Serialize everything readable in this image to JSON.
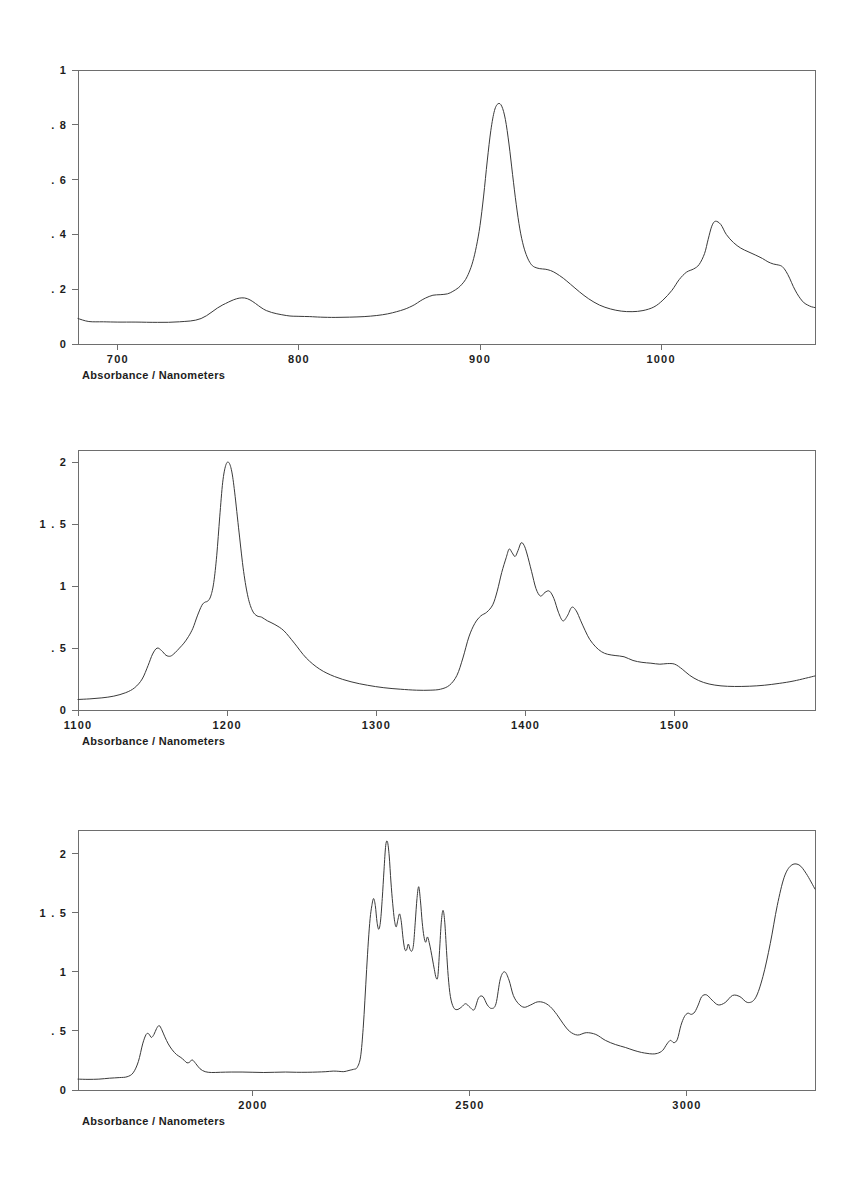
{
  "document": {
    "title": "Absorbance / Nanometers",
    "background_color": "#ffffff",
    "trace_color": "#3a3a3a",
    "axis_color": "#6e6e6e",
    "panel_count": 3
  },
  "chart_data": [
    {
      "type": "line",
      "title": "",
      "caption": "Absorbance / Nanometers",
      "xlabel": "Nanometers",
      "ylabel": "Absorbance",
      "xlim": [
        678,
        1085
      ],
      "ylim": [
        0,
        1
      ],
      "grid": false,
      "legend": "none",
      "xticks": [
        700,
        800,
        900,
        1000
      ],
      "xtick_labels": [
        "700",
        "800",
        "900",
        "1000"
      ],
      "yticks": [
        0,
        0.2,
        0.4,
        0.6,
        0.8,
        1
      ],
      "ytick_labels": [
        "0",
        ". 2",
        ". 4",
        ". 6",
        ". 8",
        "1"
      ],
      "series": [
        {
          "name": "spectrum-700-1100",
          "x": [
            678,
            684,
            692,
            700,
            710,
            722,
            734,
            746,
            758,
            770,
            782,
            793,
            800,
            806,
            812,
            820,
            828,
            836,
            843,
            849,
            854,
            858,
            861,
            864,
            867,
            870,
            874,
            878,
            882,
            885,
            888,
            890,
            892,
            894,
            896,
            898,
            900,
            902,
            904,
            906,
            908,
            910,
            912,
            914,
            916,
            918,
            920,
            922,
            924,
            926,
            928,
            930,
            933,
            936,
            939,
            942,
            946,
            950,
            955,
            960,
            966,
            972,
            978,
            984,
            990,
            996,
            1001,
            1006,
            1010,
            1014,
            1018,
            1021,
            1024,
            1026,
            1028,
            1030,
            1033,
            1036,
            1040,
            1044,
            1048,
            1052,
            1056,
            1059,
            1062,
            1065,
            1067,
            1069,
            1071,
            1073,
            1075,
            1077,
            1079,
            1081,
            1083,
            1085
          ],
          "y": [
            0.093,
            0.082,
            0.081,
            0.08,
            0.08,
            0.079,
            0.081,
            0.093,
            0.143,
            0.168,
            0.122,
            0.104,
            0.101,
            0.1,
            0.098,
            0.097,
            0.098,
            0.1,
            0.104,
            0.11,
            0.118,
            0.126,
            0.134,
            0.144,
            0.157,
            0.168,
            0.178,
            0.18,
            0.183,
            0.192,
            0.205,
            0.218,
            0.235,
            0.262,
            0.3,
            0.356,
            0.432,
            0.54,
            0.668,
            0.78,
            0.852,
            0.877,
            0.868,
            0.82,
            0.73,
            0.618,
            0.51,
            0.42,
            0.358,
            0.318,
            0.293,
            0.281,
            0.275,
            0.273,
            0.268,
            0.258,
            0.24,
            0.218,
            0.19,
            0.165,
            0.142,
            0.128,
            0.12,
            0.118,
            0.122,
            0.135,
            0.16,
            0.196,
            0.235,
            0.262,
            0.274,
            0.29,
            0.33,
            0.382,
            0.43,
            0.448,
            0.436,
            0.4,
            0.37,
            0.35,
            0.337,
            0.325,
            0.312,
            0.3,
            0.292,
            0.288,
            0.282,
            0.265,
            0.24,
            0.21,
            0.185,
            0.165,
            0.15,
            0.142,
            0.136,
            0.133
          ]
        }
      ]
    },
    {
      "type": "line",
      "title": "",
      "caption": "Absorbance / Nanometers",
      "xlabel": "Nanometers",
      "ylabel": "Absorbance",
      "xlim": [
        1100,
        1594
      ],
      "ylim": [
        0,
        2.1
      ],
      "grid": false,
      "legend": "none",
      "xticks": [
        1100,
        1200,
        1300,
        1400,
        1500
      ],
      "xtick_labels": [
        "1100",
        "1200",
        "1300",
        "1400",
        "1500"
      ],
      "yticks": [
        0,
        0.5,
        1,
        1.5,
        2
      ],
      "ytick_labels": [
        "0",
        ". 5",
        "1",
        "1 . 5",
        "2"
      ],
      "series": [
        {
          "name": "spectrum-1100-1600",
          "x": [
            1100,
            1108,
            1116,
            1124,
            1132,
            1138,
            1143,
            1147,
            1150,
            1153,
            1156,
            1159,
            1162,
            1165,
            1168,
            1171,
            1174,
            1177,
            1180,
            1183,
            1185,
            1187,
            1189,
            1191,
            1193,
            1195,
            1197,
            1199,
            1201,
            1203,
            1205,
            1208,
            1211,
            1214,
            1217,
            1220,
            1223,
            1227,
            1232,
            1238,
            1245,
            1253,
            1262,
            1272,
            1283,
            1294,
            1305,
            1316,
            1327,
            1336,
            1343,
            1349,
            1354,
            1358,
            1362,
            1366,
            1370,
            1374,
            1378,
            1381,
            1384,
            1387,
            1389,
            1391,
            1393,
            1395,
            1397,
            1399,
            1401,
            1404,
            1407,
            1410,
            1413,
            1416,
            1419,
            1422,
            1425,
            1428,
            1431,
            1434,
            1437,
            1440,
            1443,
            1447,
            1451,
            1455,
            1460,
            1466,
            1472,
            1478,
            1484,
            1490,
            1495,
            1500,
            1505,
            1510,
            1516,
            1523,
            1531,
            1540,
            1550,
            1560,
            1570,
            1580,
            1594
          ],
          "y": [
            0.085,
            0.09,
            0.098,
            0.112,
            0.14,
            0.18,
            0.25,
            0.36,
            0.452,
            0.5,
            0.48,
            0.442,
            0.435,
            0.462,
            0.5,
            0.54,
            0.592,
            0.66,
            0.76,
            0.845,
            0.87,
            0.88,
            0.92,
            1.03,
            1.25,
            1.56,
            1.84,
            1.975,
            2.0,
            1.93,
            1.76,
            1.43,
            1.12,
            0.91,
            0.8,
            0.76,
            0.75,
            0.72,
            0.69,
            0.64,
            0.54,
            0.42,
            0.33,
            0.27,
            0.228,
            0.2,
            0.18,
            0.168,
            0.16,
            0.16,
            0.168,
            0.2,
            0.28,
            0.42,
            0.59,
            0.7,
            0.76,
            0.79,
            0.85,
            0.96,
            1.11,
            1.23,
            1.3,
            1.27,
            1.24,
            1.29,
            1.35,
            1.33,
            1.26,
            1.12,
            0.98,
            0.92,
            0.95,
            0.96,
            0.9,
            0.79,
            0.72,
            0.76,
            0.83,
            0.8,
            0.72,
            0.64,
            0.57,
            0.51,
            0.47,
            0.45,
            0.44,
            0.43,
            0.4,
            0.385,
            0.378,
            0.37,
            0.375,
            0.37,
            0.33,
            0.28,
            0.238,
            0.21,
            0.195,
            0.19,
            0.192,
            0.2,
            0.215,
            0.235,
            0.275
          ]
        }
      ]
    },
    {
      "type": "line",
      "title": "",
      "caption": "Absorbance / Nanometers",
      "xlabel": "Nanometers",
      "ylabel": "Absorbance",
      "xlim": [
        1597,
        3295
      ],
      "ylim": [
        0,
        2.2
      ],
      "grid": false,
      "legend": "none",
      "xticks": [
        2000,
        2500,
        3000
      ],
      "xtick_labels": [
        "2000",
        "2500",
        "3000"
      ],
      "yticks": [
        0,
        0.5,
        1,
        1.5,
        2
      ],
      "ytick_labels": [
        "0",
        ". 5",
        "1",
        "1 . 5",
        "2"
      ],
      "series": [
        {
          "name": "spectrum-1600-3300",
          "x": [
            1597,
            1620,
            1645,
            1670,
            1692,
            1710,
            1724,
            1736,
            1746,
            1754,
            1760,
            1766,
            1772,
            1778,
            1784,
            1790,
            1797,
            1805,
            1814,
            1824,
            1834,
            1842,
            1848,
            1854,
            1860,
            1868,
            1878,
            1890,
            1905,
            1925,
            1950,
            1975,
            2000,
            2025,
            2050,
            2075,
            2100,
            2125,
            2148,
            2168,
            2185,
            2198,
            2208,
            2216,
            2224,
            2232,
            2240,
            2248,
            2254,
            2258,
            2262,
            2266,
            2270,
            2274,
            2278,
            2282,
            2286,
            2290,
            2294,
            2298,
            2302,
            2306,
            2310,
            2314,
            2318,
            2322,
            2326,
            2330,
            2334,
            2338,
            2342,
            2346,
            2350,
            2354,
            2358,
            2362,
            2366,
            2370,
            2374,
            2378,
            2382,
            2386,
            2390,
            2394,
            2398,
            2402,
            2406,
            2410,
            2414,
            2418,
            2422,
            2426,
            2430,
            2434,
            2438,
            2442,
            2446,
            2450,
            2455,
            2462,
            2470,
            2480,
            2490,
            2500,
            2510,
            2520,
            2530,
            2540,
            2550,
            2560,
            2570,
            2580,
            2590,
            2600,
            2612,
            2625,
            2640,
            2655,
            2670,
            2685,
            2700,
            2715,
            2730,
            2748,
            2768,
            2790,
            2812,
            2835,
            2858,
            2878,
            2895,
            2908,
            2920,
            2932,
            2944,
            2954,
            2962,
            2970,
            2978,
            2986,
            2994,
            3002,
            3010,
            3018,
            3026,
            3034,
            3045,
            3058,
            3072,
            3088,
            3105,
            3122,
            3140,
            3158,
            3175,
            3192,
            3208,
            3224,
            3240,
            3258,
            3275,
            3295
          ],
          "y": [
            0.092,
            0.09,
            0.092,
            0.1,
            0.105,
            0.112,
            0.145,
            0.24,
            0.39,
            0.47,
            0.475,
            0.445,
            0.47,
            0.52,
            0.545,
            0.51,
            0.45,
            0.39,
            0.34,
            0.3,
            0.275,
            0.25,
            0.23,
            0.235,
            0.255,
            0.225,
            0.18,
            0.155,
            0.148,
            0.15,
            0.152,
            0.152,
            0.15,
            0.148,
            0.15,
            0.152,
            0.15,
            0.15,
            0.152,
            0.155,
            0.16,
            0.158,
            0.155,
            0.16,
            0.168,
            0.175,
            0.19,
            0.28,
            0.52,
            0.76,
            1.02,
            1.26,
            1.45,
            1.56,
            1.62,
            1.56,
            1.42,
            1.36,
            1.43,
            1.62,
            1.86,
            2.07,
            2.1,
            1.98,
            1.76,
            1.58,
            1.44,
            1.38,
            1.44,
            1.49,
            1.42,
            1.28,
            1.19,
            1.185,
            1.235,
            1.19,
            1.175,
            1.23,
            1.42,
            1.62,
            1.72,
            1.6,
            1.42,
            1.3,
            1.25,
            1.295,
            1.25,
            1.18,
            1.1,
            1.02,
            0.95,
            0.96,
            1.18,
            1.42,
            1.52,
            1.42,
            1.18,
            0.96,
            0.79,
            0.7,
            0.68,
            0.7,
            0.73,
            0.7,
            0.68,
            0.78,
            0.79,
            0.72,
            0.69,
            0.73,
            0.94,
            1.0,
            0.93,
            0.8,
            0.73,
            0.7,
            0.72,
            0.745,
            0.74,
            0.705,
            0.64,
            0.56,
            0.495,
            0.465,
            0.485,
            0.47,
            0.42,
            0.385,
            0.36,
            0.335,
            0.318,
            0.31,
            0.305,
            0.31,
            0.335,
            0.39,
            0.42,
            0.4,
            0.43,
            0.545,
            0.62,
            0.65,
            0.64,
            0.66,
            0.72,
            0.79,
            0.805,
            0.76,
            0.72,
            0.74,
            0.8,
            0.79,
            0.74,
            0.78,
            0.96,
            1.24,
            1.56,
            1.8,
            1.9,
            1.905,
            1.83,
            1.7,
            1.55,
            1.4,
            1.3,
            1.25,
            1.265,
            1.36,
            1.47,
            1.54
          ]
        }
      ]
    }
  ]
}
